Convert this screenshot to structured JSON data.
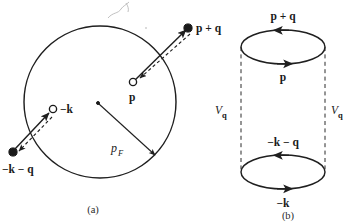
{
  "figure": {
    "panels": [
      {
        "id": "a",
        "caption": "(a)",
        "name": "fermi-sphere-panel",
        "labels": {
          "p_plus_q": "p + q",
          "p": "p",
          "minus_k": "−k",
          "minus_k_minus_q": "−k − q",
          "p_fermi_main": "p",
          "p_fermi_sub": "F"
        }
      },
      {
        "id": "b",
        "caption": "(b)",
        "name": "bubble-diagram-panel",
        "labels": {
          "top_upper": "p + q",
          "top_lower": "p",
          "bottom_upper": "−k − q",
          "bottom_lower": "−k",
          "interaction_left_main": "V",
          "interaction_left_sub": "q",
          "interaction_right_main": "V",
          "interaction_right_sub": "q"
        }
      }
    ]
  },
  "colors": {
    "ink": "#1a1a1a",
    "line": "#1f1f1f",
    "dashed": "#2b2b2b",
    "background": "#ffffff",
    "artifact": "#b9b9b9"
  }
}
